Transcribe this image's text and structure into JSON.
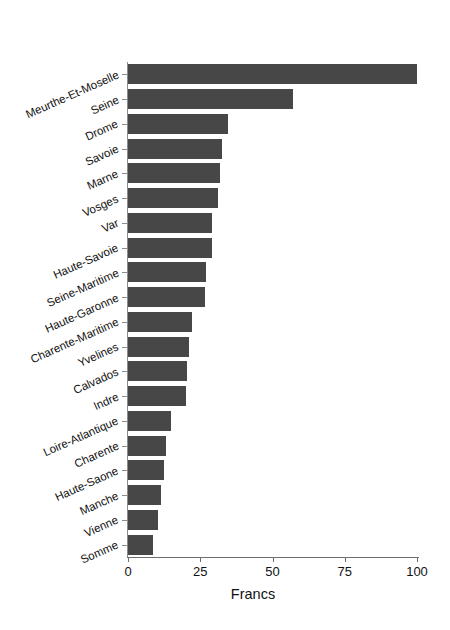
{
  "chart_data": {
    "type": "bar",
    "orientation": "horizontal",
    "title": "",
    "subtitle": "",
    "xlabel": "Francs",
    "ylabel": "",
    "xlim": [
      0,
      105
    ],
    "xticks": [
      0,
      25,
      50,
      75,
      100
    ],
    "xtick_labels": [
      "0",
      "25",
      "50",
      "75",
      "100"
    ],
    "grid": false,
    "legend": null,
    "bar_color": "#474747",
    "axis_color": "#808080",
    "categories": [
      "Meurthe-Et-Moselle",
      "Seine",
      "Drome",
      "Savoie",
      "Marne",
      "Vosges",
      "Var",
      "Haute-Savoie",
      "Seine-Maritime",
      "Haute-Garonne",
      "Charente-Maritime",
      "Yvelines",
      "Calvados",
      "Indre",
      "Loire-Atlantique",
      "Charente",
      "Haute-Saone",
      "Manche",
      "Vienne",
      "Somme"
    ],
    "values": [
      100.0,
      57.0,
      34.5,
      32.5,
      32.0,
      31.0,
      29.0,
      29.0,
      27.0,
      26.5,
      22.0,
      21.0,
      20.5,
      20.0,
      15.0,
      13.0,
      12.5,
      11.5,
      10.5,
      8.5
    ]
  }
}
